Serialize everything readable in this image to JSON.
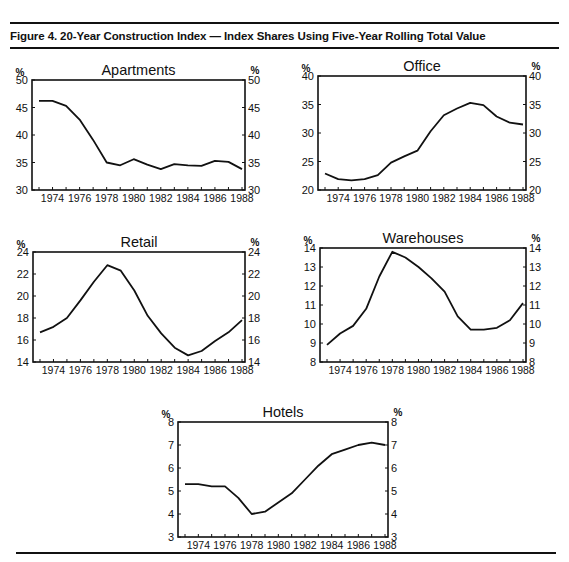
{
  "figure": {
    "title": "Figure 4. 20-Year Construction Index — Index Shares Using Five-Year Rolling Total Value",
    "unit_label": "%"
  },
  "chart_data": [
    {
      "type": "line",
      "title": "Apartments",
      "xlabel": "",
      "ylabel": "%",
      "x": [
        1973,
        1974,
        1975,
        1976,
        1977,
        1978,
        1979,
        1980,
        1981,
        1982,
        1983,
        1984,
        1985,
        1986,
        1987,
        1988
      ],
      "values": [
        46.2,
        46.2,
        45.3,
        42.8,
        39.1,
        35.0,
        34.5,
        35.6,
        34.6,
        33.8,
        34.7,
        34.5,
        34.4,
        35.3,
        35.1,
        33.8
      ],
      "xticks": [
        "1974",
        "1976",
        "1978",
        "1980",
        "1982",
        "1984",
        "1986",
        "1988"
      ],
      "yticks": [
        30,
        35,
        40,
        45,
        50
      ],
      "ylim": [
        30,
        50
      ],
      "grid": false,
      "legend": "none",
      "dual_y_axis": true
    },
    {
      "type": "line",
      "title": "Office",
      "xlabel": "",
      "ylabel": "%",
      "x": [
        1973,
        1974,
        1975,
        1976,
        1977,
        1978,
        1979,
        1980,
        1981,
        1982,
        1983,
        1984,
        1985,
        1986,
        1987,
        1988
      ],
      "values": [
        22.9,
        21.9,
        21.7,
        21.9,
        22.6,
        24.8,
        25.9,
        26.9,
        30.3,
        33.1,
        34.3,
        35.3,
        34.9,
        32.9,
        31.8,
        31.5
      ],
      "xticks": [
        "1974",
        "1976",
        "1978",
        "1980",
        "1982",
        "1984",
        "1986",
        "1988"
      ],
      "yticks": [
        20,
        25,
        30,
        35,
        40
      ],
      "ylim": [
        20,
        40
      ],
      "grid": false,
      "legend": "none",
      "dual_y_axis": true
    },
    {
      "type": "line",
      "title": "Retail",
      "xlabel": "",
      "ylabel": "%",
      "x": [
        1973,
        1974,
        1975,
        1976,
        1977,
        1978,
        1979,
        1980,
        1981,
        1982,
        1983,
        1984,
        1985,
        1986,
        1987,
        1988
      ],
      "values": [
        16.7,
        17.2,
        18.0,
        19.6,
        21.3,
        22.8,
        22.3,
        20.5,
        18.2,
        16.6,
        15.3,
        14.6,
        15.0,
        15.9,
        16.7,
        17.8
      ],
      "xticks": [
        "1974",
        "1976",
        "1978",
        "1980",
        "1982",
        "1984",
        "1986",
        "1988"
      ],
      "yticks": [
        14,
        16,
        18,
        20,
        22,
        24
      ],
      "ylim": [
        14,
        24
      ],
      "grid": false,
      "legend": "none",
      "dual_y_axis": true
    },
    {
      "type": "line",
      "title": "Warehouses",
      "xlabel": "",
      "ylabel": "%",
      "x": [
        1973,
        1974,
        1975,
        1976,
        1977,
        1978,
        1979,
        1980,
        1981,
        1982,
        1983,
        1984,
        1985,
        1986,
        1987,
        1988
      ],
      "values": [
        8.9,
        9.5,
        9.9,
        10.8,
        12.5,
        13.8,
        13.5,
        13.0,
        12.4,
        11.7,
        10.4,
        9.7,
        9.7,
        9.8,
        10.2,
        11.1
      ],
      "xticks": [
        "1974",
        "1976",
        "1978",
        "1980",
        "1982",
        "1984",
        "1986",
        "1988"
      ],
      "yticks": [
        8,
        9,
        10,
        11,
        12,
        13,
        14
      ],
      "ylim": [
        8,
        14
      ],
      "grid": false,
      "legend": "none",
      "dual_y_axis": true
    },
    {
      "type": "line",
      "title": "Hotels",
      "xlabel": "",
      "ylabel": "%",
      "x": [
        1973,
        1974,
        1975,
        1976,
        1977,
        1978,
        1979,
        1980,
        1981,
        1982,
        1983,
        1984,
        1985,
        1986,
        1987,
        1988
      ],
      "values": [
        5.3,
        5.3,
        5.2,
        5.2,
        4.7,
        4.0,
        4.1,
        4.5,
        4.9,
        5.5,
        6.1,
        6.6,
        6.8,
        7.0,
        7.1,
        7.0
      ],
      "xticks": [
        "1974",
        "1976",
        "1978",
        "1980",
        "1982",
        "1984",
        "1986",
        "1988"
      ],
      "yticks": [
        3,
        4,
        5,
        6,
        7,
        8
      ],
      "ylim": [
        3,
        8
      ],
      "grid": false,
      "legend": "none",
      "dual_y_axis": true
    }
  ]
}
